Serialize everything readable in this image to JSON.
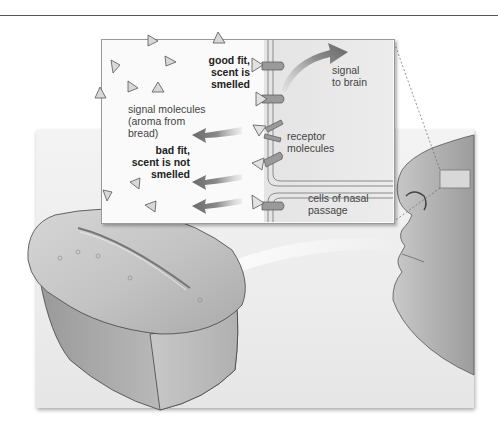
{
  "figure": {
    "labels": {
      "good_fit": [
        "good fit,",
        "scent is",
        "smelled"
      ],
      "signal_molecules": [
        "signal molecules",
        "(aroma from",
        "bread)"
      ],
      "bad_fit": [
        "bad fit,",
        "scent is not",
        "smelled"
      ],
      "signal_to_brain": [
        "signal",
        "to brain"
      ],
      "receptor_molecules": [
        "receptor",
        "molecules"
      ],
      "cells_of_nasal_passage": [
        "cells of nasal",
        "passage"
      ]
    },
    "colors": {
      "background": "#ffffff",
      "backdrop": "#eeeeee",
      "inset_bg": "#fafafa",
      "membrane": "#8a8a8a",
      "arrow": "#6f6f6f",
      "text": "#444444",
      "bold_text": "#222222"
    },
    "elements": {
      "bread": "loaf-of-bread",
      "face": "human-face-profile",
      "magnified_region": "nasal-passage-inset"
    }
  }
}
